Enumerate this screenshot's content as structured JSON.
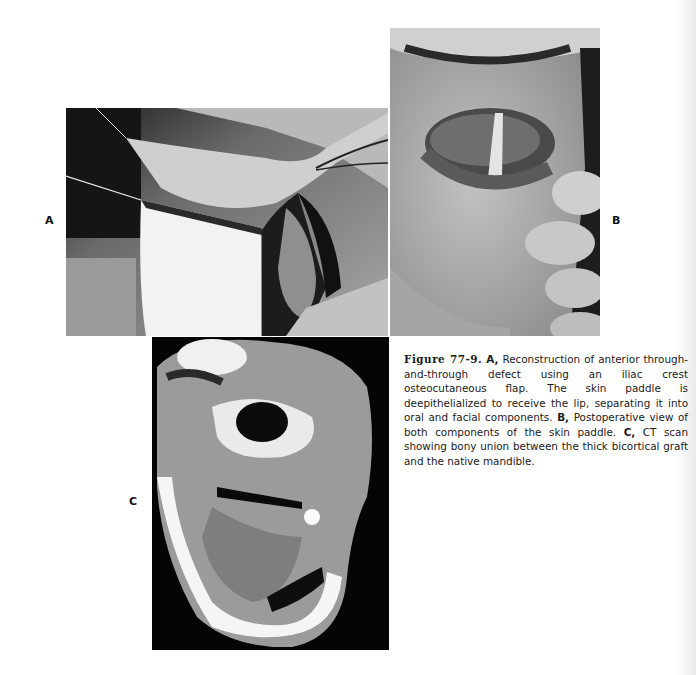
{
  "figure": {
    "panels": [
      {
        "label": "A",
        "description": "Intraoperative photograph of iliac crest osteocutaneous flap reconstruction with deepithelialized skin paddle"
      },
      {
        "label": "B",
        "description": "Postoperative photograph of lower lip and chin held by fingers"
      },
      {
        "label": "C",
        "description": "Axial CT scan of mandible"
      }
    ],
    "caption": {
      "figure_number": "Figure 77-9.",
      "part_a_label": "A,",
      "part_a_text": " Reconstruction of anterior through-and-through defect using an iliac crest osteocutaneous flap. The skin paddle is deepithelialized to receive the lip, separating it into oral and facial components. ",
      "part_b_label": "B,",
      "part_b_text": " Postoperative view of both components of the skin paddle. ",
      "part_c_label": "C,",
      "part_c_text": " CT scan showing bony union between the thick bicortical graft and the native mandible."
    }
  }
}
